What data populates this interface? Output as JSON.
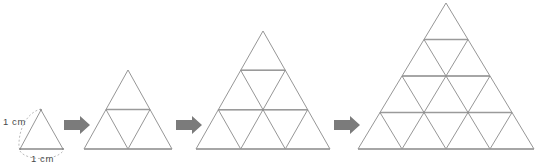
{
  "figure": {
    "background_color": "#ffffff",
    "line_color": "#8a8a8a",
    "highlight_line_color": "#9a9a9a",
    "arrow_color": "#7b7b7b",
    "label_color": "#4a4a4a",
    "labels": {
      "side_label": "1 cm",
      "base_label": "1 cm"
    },
    "steps": [
      {
        "index": 1,
        "name": "stage-1-triangle",
        "subdivisions": 1,
        "unit_triangles": 1,
        "apex_x": 41,
        "apex_y": 110,
        "base_left_x": 20,
        "base_right_x": 63,
        "base_y": 149,
        "side_cm": 1
      },
      {
        "index": 2,
        "name": "stage-2-triangle",
        "subdivisions": 2,
        "unit_triangles": 4,
        "apex_x": 128,
        "apex_y": 70,
        "base_left_x": 84,
        "base_right_x": 172,
        "base_y": 149,
        "side_cm": 2
      },
      {
        "index": 3,
        "name": "stage-3-triangle",
        "subdivisions": 3,
        "unit_triangles": 9,
        "apex_x": 263,
        "apex_y": 31,
        "base_left_x": 196,
        "base_right_x": 330,
        "base_y": 149,
        "side_cm": 3
      },
      {
        "index": 4,
        "name": "stage-4-triangle",
        "subdivisions": 4,
        "unit_triangles": 16,
        "apex_x": 446,
        "apex_y": 3,
        "base_left_x": 358,
        "base_right_x": 534,
        "base_y": 149,
        "side_cm": 4
      }
    ],
    "arrows": [
      {
        "index": 1,
        "name": "arrow-1-to-2",
        "x": 64,
        "y": 117,
        "width": 26,
        "height": 16
      },
      {
        "index": 2,
        "name": "arrow-2-to-3",
        "x": 172,
        "y": 117,
        "width": 26,
        "height": 16
      },
      {
        "index": 3,
        "name": "arrow-3-to-4",
        "x": 330,
        "y": 117,
        "width": 26,
        "height": 16
      }
    ],
    "dimension_marks": {
      "side_arc": {
        "name": "side-dimension-arc",
        "label_x": 3,
        "label_y": 125
      },
      "base_arc": {
        "name": "base-dimension-arc",
        "label_x": 31,
        "label_y": 162
      }
    }
  }
}
